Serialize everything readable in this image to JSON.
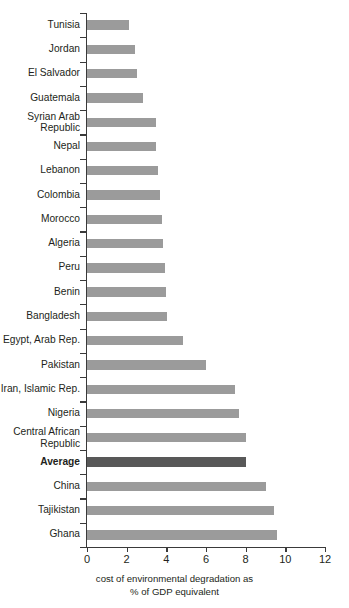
{
  "chart_data": {
    "type": "bar",
    "orientation": "horizontal",
    "title": "",
    "xlabel": "cost of environmental degradation as\n% of GDP equivalent",
    "xlabel_lines": [
      "cost of environmental degradation as",
      "% of GDP equivalent"
    ],
    "ylabel": "",
    "xlim": [
      0,
      12
    ],
    "xticks": [
      0,
      2,
      4,
      6,
      8,
      10,
      12
    ],
    "xtick_labels": [
      "0",
      "2",
      "4",
      "6",
      "8",
      "10",
      "12"
    ],
    "grid": false,
    "legend": false,
    "bar_color": "#9b9b9b",
    "highlight_color": "#585858",
    "highlight_category": "Average",
    "categories": [
      "Tunisia",
      "Jordan",
      "El Salvador",
      "Guatemala",
      "Syrian Arab\nRepublic",
      "Nepal",
      "Lebanon",
      "Colombia",
      "Morocco",
      "Algeria",
      "Peru",
      "Benin",
      "Bangladesh",
      "Egypt, Arab Rep.",
      "Pakistan",
      "Iran, Islamic Rep.",
      "Nigeria",
      "Central African\nRepublic",
      "Average",
      "China",
      "Tajikistan",
      "Ghana"
    ],
    "values": [
      2.1,
      2.4,
      2.5,
      2.8,
      3.5,
      3.5,
      3.6,
      3.7,
      3.8,
      3.85,
      3.95,
      4.0,
      4.05,
      4.85,
      6.0,
      7.45,
      7.65,
      8.0,
      8.0,
      9.05,
      9.45,
      9.6
    ]
  }
}
